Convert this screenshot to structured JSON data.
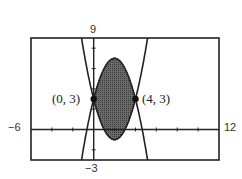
{
  "chart_data": {
    "type": "area",
    "title": "",
    "window": {
      "xmin": -6,
      "xmax": 12,
      "ymin": -3,
      "ymax": 9,
      "xscl": 1,
      "yscl": 1
    },
    "tick_labels": {
      "ymax": "9",
      "ymin": "-3",
      "xmin": "-6",
      "xmax": "12"
    },
    "xlim": [
      -6,
      12
    ],
    "ylim": [
      -3,
      9
    ],
    "grid": false,
    "series": [
      {
        "name": "upper parabola",
        "equation": "y = -x^2 + 4x + 3",
        "style": "solid thick"
      },
      {
        "name": "lower parabola",
        "equation": "y = x^2 - 4x + 3",
        "style": "solid thick"
      }
    ],
    "shaded_region": {
      "between": [
        "lower parabola",
        "upper parabola"
      ],
      "x_range": [
        0,
        4
      ],
      "fill": "#555555"
    },
    "annotations": [
      {
        "label": "(0, 3)",
        "x": 0,
        "y": 3
      },
      {
        "label": "(4, 3)",
        "x": 4,
        "y": 3
      }
    ]
  },
  "labels": {
    "ymax": "9",
    "ymin": "−3",
    "xmin": "−6",
    "xmax": "12",
    "point_left": "(0, 3)",
    "point_right": "(4, 3)"
  }
}
